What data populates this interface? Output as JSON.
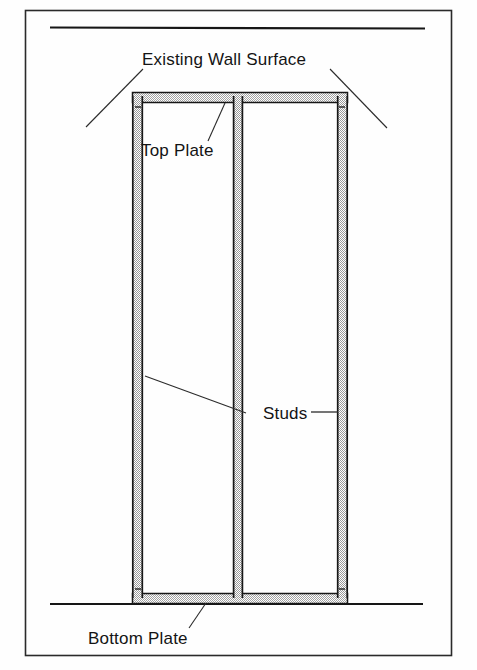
{
  "figure": {
    "type": "line-drawing",
    "background_color": "#fefefe",
    "ink_color": "#141414",
    "stipple_color": "#b8b8b8",
    "border": {
      "x": 25,
      "y": 10,
      "width": 427,
      "height": 646
    }
  },
  "labels": {
    "existing_wall_surface": "Existing Wall Surface",
    "top_plate": "Top Plate",
    "studs": "Studs",
    "bottom_plate": "Bottom Plate"
  },
  "diagram_parts": {
    "ceiling_line": {
      "name": "ceiling-line",
      "x1": 50,
      "y1": 27,
      "x2": 425,
      "y2": 28
    },
    "floor_line": {
      "name": "floor-line",
      "x1": 50,
      "y1": 604,
      "x2": 423,
      "y2": 604
    },
    "frame": {
      "left": 132,
      "right": 348,
      "top": 92,
      "bottom": 604
    },
    "top_plate_bar": {
      "x": 132,
      "y": 92,
      "width": 216,
      "height": 11
    },
    "bottom_plate_bar": {
      "x": 132,
      "y": 593,
      "width": 216,
      "height": 11
    },
    "stud_left": {
      "x": 132,
      "y": 92,
      "width": 11,
      "height": 512
    },
    "stud_middle": {
      "x": 233,
      "y": 96,
      "width": 10,
      "height": 502
    },
    "stud_right": {
      "x": 337,
      "y": 92,
      "width": 11,
      "height": 512
    }
  },
  "leader_lines": {
    "wall_surface_left": {
      "x1": 143,
      "y1": 69,
      "x2": 86,
      "y2": 127
    },
    "wall_surface_right": {
      "x1": 330,
      "y1": 69,
      "x2": 387,
      "y2": 128
    },
    "top_plate": {
      "x1": 225,
      "y1": 103,
      "x2": 208,
      "y2": 140
    },
    "studs_left": {
      "x1": 145,
      "y1": 376,
      "x2": 245,
      "y2": 413
    },
    "studs_right": {
      "x1": 311,
      "y1": 412,
      "x2": 338,
      "y2": 412
    },
    "bottom_plate": {
      "x1": 206,
      "y1": 603,
      "x2": 189,
      "y2": 627
    }
  },
  "text_positions": {
    "existing_wall_surface": {
      "x": 142,
      "y": 65
    },
    "top_plate": {
      "x": 141,
      "y": 156
    },
    "studs": {
      "x": 263,
      "y": 419
    },
    "bottom_plate": {
      "x": 88,
      "y": 644
    }
  }
}
